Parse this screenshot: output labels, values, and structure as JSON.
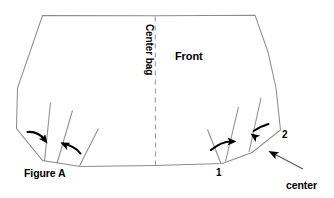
{
  "figure": {
    "caption": "Figure A",
    "panel_label": "Front",
    "center_line_label": "Center bag",
    "tuck_callout": "center\ntuck",
    "tuck_callout_line1": "center",
    "tuck_callout_line2": "tuck",
    "corner_markers": [
      {
        "id": "marker-1",
        "label": "1"
      },
      {
        "id": "marker-2",
        "label": "2"
      }
    ],
    "colors": {
      "background": "#ffffff",
      "outline": "#8c8c8c",
      "center_dashed_line": "#9a9a9a",
      "arrow": "#000000",
      "leader": "#555555",
      "text": "#000000"
    },
    "shapes": {
      "outline_path": "M 42.5 15.5 L 155 15.8 L 255 15.2 L 268 52 L 276 88 L 280.5 130 L 252 152.5 L 222.5 163.5 L 155.5 165.5 L 80.5 166.5 L 42.5 160.5 L 16.5 128.5 L 17.5 88 Z",
      "center_dashed": "M 155.2 16.5 L 155.5 165",
      "left_tuck_lines": [
        "M 44.5 161.5 L 50.5 102.5",
        "M 57 163.5 L 72.5 110.5",
        "M 79.5 166 L 98.5 128.5"
      ],
      "right_tuck_lines": [
        "M 221 163.5 L 207.5 129.5",
        "M 225.5 161.5 L 238.5 107",
        "M 249 152 L 261 98"
      ],
      "left_arrows": [
        {
          "curve": "M 27.5 132 Q 38 131 45 140",
          "tip": [
            47.5,
            143.5
          ],
          "angle": 52
        },
        {
          "curve": "M 62.5 143.5 Q 75 146 80.5 153.5",
          "tip": [
            60.5,
            142.5
          ],
          "angle": 205
        }
      ],
      "right_arrows": [
        {
          "curve": "M 211 150 Q 222 141 232 141.5",
          "tip": [
            236.5,
            141.5
          ],
          "angle": 0
        },
        {
          "curve": "M 268.5 124 Q 260 126.5 253.5 131",
          "tip": [
            250.5,
            133.5
          ],
          "angle": 215
        }
      ],
      "leader": {
        "line": "M 303 169 L 272.5 153",
        "tip": [
          268.5,
          151
        ],
        "angle": 208
      }
    }
  }
}
